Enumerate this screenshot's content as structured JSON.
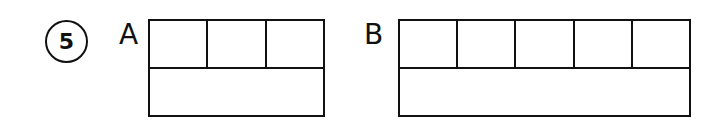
{
  "problem": {
    "number": "5"
  },
  "figures": [
    {
      "label": "A",
      "top_row_cells": 3,
      "bottom_row_cells": 1
    },
    {
      "label": "B",
      "top_row_cells": 5,
      "bottom_row_cells": 1
    }
  ],
  "colors": {
    "line": "#111111",
    "background": "#ffffff"
  }
}
